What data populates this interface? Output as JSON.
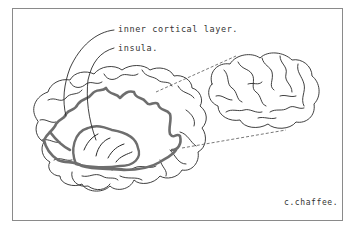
{
  "figure": {
    "labels": [
      {
        "id": "inner-cortical-layer",
        "text": "inner cortical layer."
      },
      {
        "id": "insula",
        "text": "insula."
      }
    ],
    "signature": "c.chaffee.",
    "colors": {
      "outline": "#2a2a2a",
      "cortical_band": "#6e6e6e",
      "frame": "#8a8a8a",
      "dashed": "#555555"
    }
  }
}
